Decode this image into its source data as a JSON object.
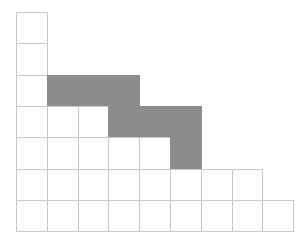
{
  "grid": {
    "origin_x": 16,
    "origin_y": 12,
    "cell_w": 30.8,
    "cell_h": 31.3,
    "colors": {
      "empty": "#ffffff",
      "shaded": "#8c8c8c",
      "line": "#c8c8c8"
    },
    "rows": [
      {
        "cells": 1,
        "shaded": []
      },
      {
        "cells": 1,
        "shaded": []
      },
      {
        "cells": 4,
        "shaded": [
          1,
          2,
          3
        ]
      },
      {
        "cells": 6,
        "shaded": [
          3,
          4,
          5
        ]
      },
      {
        "cells": 6,
        "shaded": [
          5
        ]
      },
      {
        "cells": 8,
        "shaded": []
      },
      {
        "cells": 9,
        "shaded": []
      }
    ]
  }
}
